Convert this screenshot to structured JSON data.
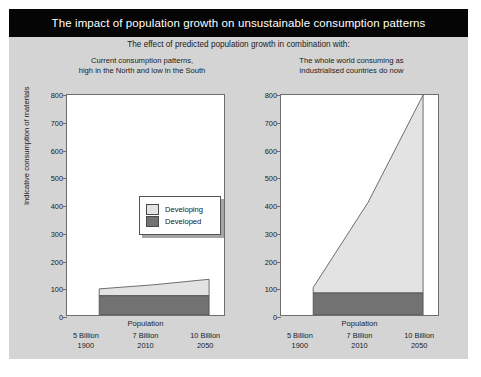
{
  "header": {
    "title": "The impact of population growth on unsustainable consumption patterns",
    "subtitle": "The effect of predicted population growth in combination with:"
  },
  "panels": [
    {
      "id": "left",
      "title_line1": "Current consumption patterns,",
      "title_line2": "high in the North and low in the South"
    },
    {
      "id": "right",
      "title_line1": "The whole world consuming as",
      "title_line2": "industrialised countries do now"
    }
  ],
  "axes": {
    "ylabel": "Indicative consumption of materials",
    "xlabel": "Population",
    "yticks": [
      "800",
      "700",
      "600",
      "500",
      "400",
      "300",
      "200",
      "100",
      "0"
    ],
    "xticks": [
      {
        "top": "5 Billion",
        "bottom": "1900"
      },
      {
        "top": "7 Billion",
        "bottom": "2010"
      },
      {
        "top": "10 Billion",
        "bottom": "2050"
      }
    ]
  },
  "legend": {
    "developing": "Developing",
    "developed": "Developed"
  },
  "colors": {
    "title_bar": "#050505",
    "figure_background": "#d4d4d4",
    "plot_background": "#ffffff",
    "developing": "#e3e3e3",
    "developed": "#727272",
    "axis": "#6e6e6e"
  },
  "chart_data": {
    "type": "area",
    "title": "The impact of population growth on unsustainable consumption patterns",
    "subtitle": "The effect of predicted population growth in combination with:",
    "xlabel": "Population",
    "ylabel": "Indicative consumption of materials",
    "ylim": [
      0,
      800
    ],
    "ytick_step": 100,
    "grid": false,
    "legend_position": "top-left inside plot",
    "x": [
      "5 Billion / 1900",
      "7 Billion / 2010",
      "10 Billion / 2050"
    ],
    "panels": [
      {
        "name": "Current consumption patterns, high in the North and low in the South",
        "series": [
          {
            "name": "Developed",
            "values": [
              70,
              70,
              70
            ]
          },
          {
            "name": "Developing",
            "values": [
              25,
              40,
              60
            ]
          }
        ],
        "totals": [
          95,
          110,
          130
        ]
      },
      {
        "name": "The whole world consuming as industrialised countries do now",
        "series": [
          {
            "name": "Developed",
            "values": [
              80,
              80,
              80
            ]
          },
          {
            "name": "Developing",
            "values": [
              20,
              330,
              720
            ]
          }
        ],
        "totals": [
          100,
          410,
          800
        ]
      }
    ]
  }
}
